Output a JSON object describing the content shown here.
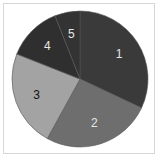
{
  "chart_data": {
    "type": "pie",
    "title": "",
    "labels": [
      "1",
      "2",
      "3",
      "4",
      "5"
    ],
    "values": [
      32,
      26,
      23,
      13,
      6
    ],
    "start_angle": "12 o'clock, clockwise",
    "colors": [
      "#3a3a3a",
      "#6e6e6e",
      "#a3a3a3",
      "#2f2f2f",
      "#333333"
    ],
    "label_colors": [
      "#e6e6e6",
      "#e6e6e6",
      "#111111",
      "#e6e6e6",
      "#e6e6e6"
    ],
    "legend": "none",
    "note": "Values are approximate readings of the slice angles; no numbers are shown in the chart."
  }
}
